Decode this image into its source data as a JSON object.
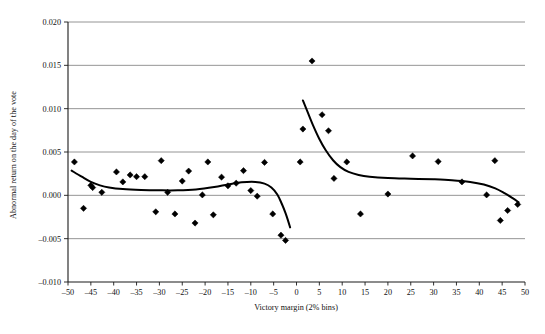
{
  "chart_data": {
    "type": "scatter",
    "title": "",
    "xlabel": "Victory margin (2% bins)",
    "ylabel": "Abnormal return on the day of the vote",
    "xlim": [
      -50,
      50
    ],
    "ylim": [
      -0.01,
      0.02
    ],
    "xticks": [
      -50,
      -45,
      -40,
      -35,
      -30,
      -25,
      -20,
      -15,
      -10,
      -5,
      0,
      5,
      10,
      15,
      20,
      25,
      30,
      35,
      40,
      45,
      50
    ],
    "xtick_labels": [
      "–50",
      "–45",
      "–40",
      "–35",
      "–30",
      "–25",
      "–20",
      "–15",
      "–10",
      "–5",
      "0",
      "5",
      "10",
      "15",
      "20",
      "25",
      "30",
      "35",
      "40",
      "45",
      "50"
    ],
    "yticks": [
      -0.01,
      -0.005,
      0.0,
      0.005,
      0.01,
      0.015,
      0.02
    ],
    "ytick_labels": [
      "–0.010",
      "–0.005",
      "0.000",
      "0.005",
      "0.010",
      "0.015",
      "0.020"
    ],
    "grid": "horizontal",
    "legend": "none",
    "marker": "diamond",
    "marker_color": "#000000",
    "curve_color": "#000000",
    "series": [
      {
        "name": "Abnormal return by victory margin bin",
        "points": [
          [
            -48.6,
            0.00385
          ],
          [
            -46.6,
            -0.0015
          ],
          [
            -45.0,
            0.00115
          ],
          [
            -44.6,
            0.0009
          ],
          [
            -42.6,
            0.00035
          ],
          [
            -39.4,
            0.0027
          ],
          [
            -38.0,
            0.00155
          ],
          [
            -36.4,
            0.00235
          ],
          [
            -35.0,
            0.00215
          ],
          [
            -33.2,
            0.00215
          ],
          [
            -30.8,
            -0.0019
          ],
          [
            -29.6,
            0.004
          ],
          [
            -28.2,
            0.00035
          ],
          [
            -26.6,
            -0.00215
          ],
          [
            -25.0,
            0.00165
          ],
          [
            -23.6,
            0.0028
          ],
          [
            -22.2,
            -0.0032
          ],
          [
            -20.6,
            5e-05
          ],
          [
            -19.4,
            0.00385
          ],
          [
            -18.2,
            -0.00225
          ],
          [
            -16.4,
            0.0021
          ],
          [
            -15.0,
            0.0011
          ],
          [
            -13.2,
            0.0014
          ],
          [
            -11.6,
            0.00285
          ],
          [
            -10.0,
            0.00055
          ],
          [
            -8.6,
            -0.0001
          ],
          [
            -7.0,
            0.0038
          ],
          [
            -5.2,
            -0.00215
          ],
          [
            -3.4,
            -0.0046
          ],
          [
            -2.4,
            -0.0052
          ],
          [
            0.8,
            0.00385
          ],
          [
            1.4,
            0.00765
          ],
          [
            3.4,
            0.0155
          ],
          [
            5.6,
            0.0093
          ],
          [
            7.0,
            0.00745
          ],
          [
            8.2,
            0.00195
          ],
          [
            11.0,
            0.00385
          ],
          [
            14.0,
            -0.00215
          ],
          [
            20.0,
            0.00015
          ],
          [
            25.4,
            0.00455
          ],
          [
            31.0,
            0.0039
          ],
          [
            36.2,
            0.00155
          ],
          [
            41.6,
            5e-05
          ],
          [
            43.4,
            0.004
          ],
          [
            44.6,
            -0.0029
          ],
          [
            46.2,
            -0.00175
          ],
          [
            48.4,
            -0.00105
          ]
        ]
      }
    ],
    "fit_curves": [
      {
        "name": "left-side-fit",
        "points": [
          [
            -49.2,
            0.00285
          ],
          [
            -47.0,
            0.00215
          ],
          [
            -45.0,
            0.00155
          ],
          [
            -43.0,
            0.00115
          ],
          [
            -41.0,
            0.0009
          ],
          [
            -38.0,
            0.00072
          ],
          [
            -34.0,
            0.00062
          ],
          [
            -30.0,
            0.00058
          ],
          [
            -26.0,
            0.00058
          ],
          [
            -22.0,
            0.00068
          ],
          [
            -18.0,
            0.00095
          ],
          [
            -15.0,
            0.00125
          ],
          [
            -12.0,
            0.0015
          ],
          [
            -9.0,
            0.00155
          ],
          [
            -7.0,
            0.00135
          ],
          [
            -5.5,
            0.0009
          ],
          [
            -4.2,
            0.0001
          ],
          [
            -3.2,
            -0.001
          ],
          [
            -2.4,
            -0.00205
          ],
          [
            -1.8,
            -0.003
          ],
          [
            -1.4,
            -0.0037
          ]
        ]
      },
      {
        "name": "right-side-fit",
        "points": [
          [
            1.4,
            0.01095
          ],
          [
            2.4,
            0.00965
          ],
          [
            3.6,
            0.0081
          ],
          [
            5.0,
            0.0065
          ],
          [
            6.4,
            0.0052
          ],
          [
            8.0,
            0.00405
          ],
          [
            9.6,
            0.00325
          ],
          [
            11.4,
            0.0027
          ],
          [
            13.6,
            0.00235
          ],
          [
            16.0,
            0.00215
          ],
          [
            20.0,
            0.002
          ],
          [
            25.0,
            0.00192
          ],
          [
            30.0,
            0.00185
          ],
          [
            34.0,
            0.00175
          ],
          [
            38.0,
            0.00155
          ],
          [
            41.0,
            0.00125
          ],
          [
            43.5,
            0.0008
          ],
          [
            45.5,
            0.00025
          ],
          [
            47.2,
            -0.0003
          ],
          [
            48.6,
            -0.0008
          ]
        ]
      }
    ]
  }
}
